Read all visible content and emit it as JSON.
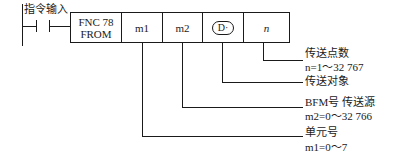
{
  "ladder": {
    "contact_label": "指令输入"
  },
  "instruction": {
    "fnc_line1": "FNC 78",
    "fnc_line2": "FROM",
    "operands": [
      "m1",
      "m2",
      "D·",
      "n"
    ]
  },
  "annotations": [
    {
      "title": "传送点数",
      "range": "n=1～32 767"
    },
    {
      "title": "传送对象",
      "range": ""
    },
    {
      "title": "BFM号 传送源",
      "range": "m2=0～32 766"
    },
    {
      "title": "单元号",
      "range": "m1=0～7"
    }
  ]
}
